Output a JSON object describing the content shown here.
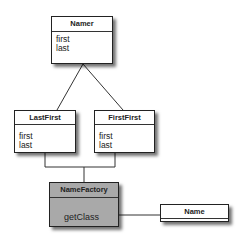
{
  "diagram": {
    "type": "uml-class-diagram",
    "classes": [
      {
        "id": "namer",
        "name": "Namer",
        "members": [
          "first",
          "last"
        ]
      },
      {
        "id": "lastfirst",
        "name": "LastFirst",
        "members": [
          "first",
          "last"
        ]
      },
      {
        "id": "firstfirst",
        "name": "FirstFirst",
        "members": [
          "first",
          "last"
        ]
      },
      {
        "id": "namefactory",
        "name": "NameFactory",
        "members": [
          "getClass"
        ],
        "fill": "#a9a9a9"
      },
      {
        "id": "name",
        "name": "Name",
        "members": []
      }
    ],
    "relations": [
      {
        "from": "lastfirst",
        "to": "namer",
        "kind": "inheritance"
      },
      {
        "from": "firstfirst",
        "to": "namer",
        "kind": "inheritance"
      },
      {
        "from": "namefactory",
        "to": "lastfirst",
        "kind": "association"
      },
      {
        "from": "namefactory",
        "to": "firstfirst",
        "kind": "association"
      },
      {
        "from": "namefactory",
        "to": "name",
        "kind": "association"
      }
    ]
  }
}
